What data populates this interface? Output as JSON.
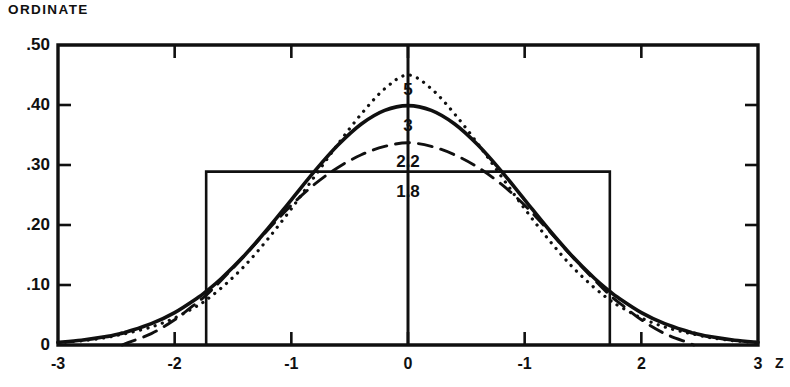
{
  "figure": {
    "ordinate_title": "ORDINATE",
    "x_axis_name": "Z"
  },
  "chart_data": {
    "type": "line",
    "title": "",
    "subtitle": "",
    "xlabel": "Z",
    "ylabel": "ORDINATE",
    "xlim": [
      -3,
      3
    ],
    "ylim": [
      0,
      0.5
    ],
    "grid": false,
    "legend_position": "inline-annotations",
    "x_ticks": [
      -3,
      -2,
      -1,
      0,
      1,
      2,
      3
    ],
    "x_tick_labels": [
      "-3",
      "-2",
      "-1",
      "0",
      "-1",
      "2",
      "3"
    ],
    "y_ticks": [
      0,
      0.1,
      0.2,
      0.3,
      0.4,
      0.5
    ],
    "y_tick_labels": [
      "0",
      ".10",
      ".20",
      ".30",
      ".40",
      ".50"
    ],
    "annotations": [
      {
        "text": "5",
        "x": 0,
        "y": 0.425,
        "series": "5"
      },
      {
        "text": "3",
        "x": 0,
        "y": 0.365,
        "series": "3"
      },
      {
        "text": "2.2",
        "x": 0,
        "y": 0.305,
        "series": "2.2"
      },
      {
        "text": "1.8",
        "x": 0,
        "y": 0.255,
        "series": "1.8"
      }
    ],
    "x": [
      -3,
      -2.8,
      -2.6,
      -2.45,
      -2.4,
      -2.2,
      -2,
      -1.8,
      -1.73,
      -1.6,
      -1.4,
      -1.2,
      -1,
      -0.8,
      -0.6,
      -0.4,
      -0.2,
      0,
      0.2,
      0.4,
      0.6,
      0.8,
      1,
      1.2,
      1.4,
      1.6,
      1.73,
      1.8,
      2,
      2.2,
      2.4,
      2.45,
      2.6,
      2.8,
      3
    ],
    "series": [
      {
        "name": "5",
        "label": "5",
        "style": "dotted",
        "kurtosis": 5,
        "peak": 0.45,
        "values": [
          0.004,
          0.007,
          0.012,
          0.018,
          0.02,
          0.03,
          0.045,
          0.066,
          0.075,
          0.095,
          0.132,
          0.177,
          0.227,
          0.281,
          0.335,
          0.385,
          0.427,
          0.45,
          0.427,
          0.385,
          0.335,
          0.281,
          0.227,
          0.177,
          0.132,
          0.095,
          0.075,
          0.066,
          0.045,
          0.03,
          0.02,
          0.018,
          0.012,
          0.007,
          0.004
        ]
      },
      {
        "name": "3",
        "label": "3",
        "style": "solid",
        "kurtosis": 3,
        "peak": 0.399,
        "values": [
          0.0044,
          0.0079,
          0.0136,
          0.0198,
          0.0224,
          0.0355,
          0.054,
          0.079,
          0.0893,
          0.1109,
          0.1497,
          0.1942,
          0.242,
          0.2897,
          0.3332,
          0.3683,
          0.391,
          0.399,
          0.391,
          0.3683,
          0.3332,
          0.2897,
          0.242,
          0.1942,
          0.1497,
          0.1109,
          0.0893,
          0.079,
          0.054,
          0.0355,
          0.0224,
          0.0198,
          0.0136,
          0.0079,
          0.0044
        ]
      },
      {
        "name": "2.2",
        "label": "2.2",
        "style": "dashed",
        "kurtosis": 2.2,
        "peak": 0.337,
        "values": [
          0,
          0,
          0,
          0,
          0.004,
          0.019,
          0.042,
          0.072,
          0.083,
          0.108,
          0.149,
          0.192,
          0.233,
          0.268,
          0.296,
          0.317,
          0.331,
          0.337,
          0.331,
          0.317,
          0.296,
          0.268,
          0.233,
          0.192,
          0.149,
          0.108,
          0.083,
          0.072,
          0.042,
          0.019,
          0.004,
          0,
          0,
          0,
          0
        ]
      },
      {
        "name": "1.8",
        "label": "1.8",
        "style": "rectangular",
        "kurtosis": 1.8,
        "peak": 0.289,
        "support": [
          -1.73,
          1.73
        ],
        "values": [
          0,
          0,
          0,
          0,
          0,
          0,
          0,
          0,
          0.289,
          0.289,
          0.289,
          0.289,
          0.289,
          0.289,
          0.289,
          0.289,
          0.289,
          0.289,
          0.289,
          0.289,
          0.289,
          0.289,
          0.289,
          0.289,
          0.289,
          0.289,
          0.289,
          0,
          0,
          0,
          0,
          0,
          0,
          0,
          0
        ]
      }
    ]
  },
  "colors": {
    "ink": "#101010",
    "background": "#ffffff"
  }
}
